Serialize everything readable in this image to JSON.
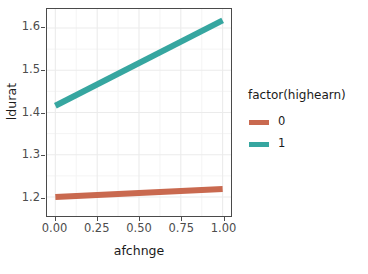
{
  "chart_data": {
    "type": "line",
    "title": "",
    "xlabel": "afchnge",
    "ylabel": "ldurat",
    "xlim": [
      -0.05,
      1.05
    ],
    "ylim": [
      1.155,
      1.645
    ],
    "grid": true,
    "legend_position": "right",
    "legend_title": "factor(highearn)",
    "x": [
      0.0,
      1.0
    ],
    "xticks": [
      "0.00",
      "0.25",
      "0.50",
      "0.75",
      "1.00"
    ],
    "xtick_values": [
      0.0,
      0.25,
      0.5,
      0.75,
      1.0
    ],
    "yticks": [
      "1.2",
      "1.3",
      "1.4",
      "1.5",
      "1.6"
    ],
    "ytick_values": [
      1.2,
      1.3,
      1.4,
      1.5,
      1.6
    ],
    "series": [
      {
        "name": "0",
        "color": "#C9694F",
        "values": [
          1.2,
          1.219
        ],
        "linewidth": 6
      },
      {
        "name": "1",
        "color": "#36A6A0",
        "values": [
          1.416,
          1.618
        ],
        "linewidth": 6
      }
    ]
  },
  "colors": {
    "panel_background": "#ffffff",
    "panel_border": "#4a4a4a",
    "grid_major": "#ebebeb",
    "grid_minor": "#f4f4f4",
    "axis_text": "#4d4d4d",
    "axis_title": "#1a1a1a",
    "series_0": "#C9694F",
    "series_1": "#36A6A0"
  }
}
